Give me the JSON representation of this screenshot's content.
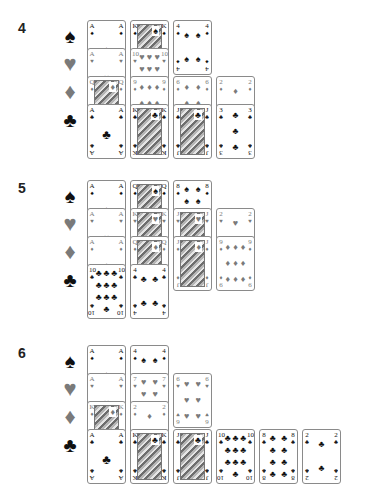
{
  "suits": [
    {
      "name": "spades",
      "glyph": "♠",
      "color": "black"
    },
    {
      "name": "hearts",
      "glyph": "♥",
      "color": "red"
    },
    {
      "name": "diamonds",
      "glyph": "♦",
      "color": "red"
    },
    {
      "name": "clubs",
      "glyph": "♣",
      "color": "black"
    }
  ],
  "colors": {
    "black": "#111111",
    "red_suit_gray": "#7a7a7a",
    "card_border": "#8a8a8a"
  },
  "sections": [
    {
      "label": "4",
      "rows": {
        "spades": [
          {
            "rank": "A"
          },
          {
            "rank": "K"
          },
          {
            "rank": "4"
          }
        ],
        "hearts": [
          {
            "rank": "A"
          },
          {
            "rank": "10"
          }
        ],
        "diamonds": [
          {
            "rank": "Q"
          },
          {
            "rank": "9"
          },
          {
            "rank": "6"
          },
          {
            "rank": "2"
          }
        ],
        "clubs": [
          {
            "rank": "A"
          },
          {
            "rank": "K"
          },
          {
            "rank": "J"
          },
          {
            "rank": "3"
          }
        ]
      }
    },
    {
      "label": "5",
      "rows": {
        "spades": [
          {
            "rank": "A"
          },
          {
            "rank": "Q"
          },
          {
            "rank": "8"
          }
        ],
        "hearts": [
          {
            "rank": "A"
          },
          {
            "rank": "K"
          },
          {
            "rank": "J"
          },
          {
            "rank": "2"
          }
        ],
        "diamonds": [
          {
            "rank": "A"
          },
          {
            "rank": "Q"
          },
          {
            "rank": "J"
          },
          {
            "rank": "9"
          }
        ],
        "clubs": [
          {
            "rank": "10"
          },
          {
            "rank": "4"
          }
        ]
      }
    },
    {
      "label": "6",
      "rows": {
        "spades": [
          {
            "rank": "A"
          },
          {
            "rank": "4"
          }
        ],
        "hearts": [
          {
            "rank": "A"
          },
          {
            "rank": "7"
          },
          {
            "rank": "6"
          }
        ],
        "diamonds": [
          {
            "rank": "K"
          },
          {
            "rank": "2"
          }
        ],
        "clubs": [
          {
            "rank": "A"
          },
          {
            "rank": "K"
          },
          {
            "rank": "J"
          },
          {
            "rank": "10"
          },
          {
            "rank": "8"
          },
          {
            "rank": "2"
          }
        ]
      }
    }
  ]
}
